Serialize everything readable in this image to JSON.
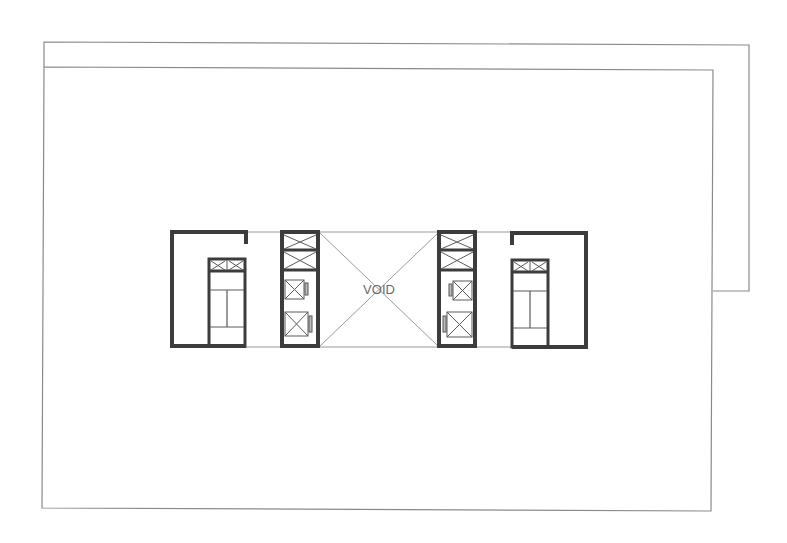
{
  "diagram": {
    "type": "architectural-floor-plan",
    "void_label": "VOID",
    "colors": {
      "background": "#ffffff",
      "outline": "#8a8a8a",
      "walls": "#3c3c3c",
      "text": "#6a6a6a"
    },
    "elements": {
      "slab_upper": "offset upper floor slab outline",
      "slab_main": "main floor slab outline",
      "core_left": "left stair core with duct shafts",
      "lift_core_left": "left lift core with two lifts",
      "void": "central void",
      "lift_core_right": "right lift core with two lifts",
      "core_right": "right stair core with duct shafts"
    }
  }
}
